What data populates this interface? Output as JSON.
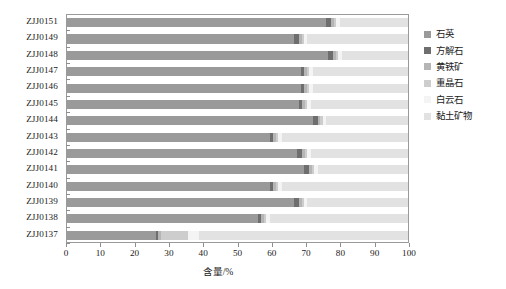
{
  "chart_data": {
    "type": "bar",
    "subtype": "horizontal-stacked-bar",
    "title": "",
    "xlabel": "含量/%",
    "ylabel": "",
    "xlim": [
      0,
      100
    ],
    "xticks": [
      0,
      10,
      20,
      30,
      40,
      50,
      60,
      70,
      80,
      90,
      100
    ],
    "grid": false,
    "legend_position": "right",
    "categories": [
      "ZJJ0151",
      "ZJJ0149",
      "ZJJ0148",
      "ZJJ0147",
      "ZJJ0146",
      "ZJJ0145",
      "ZJJ0144",
      "ZJJ0143",
      "ZJJ0142",
      "ZJJ0141",
      "ZJJ0140",
      "ZJJ0139",
      "ZJJ0138",
      "ZJJ0137"
    ],
    "series": [
      {
        "name": "石英",
        "color": "#9a9a9a",
        "values": [
          76.0,
          66.5,
          76.5,
          68.5,
          68.5,
          68.0,
          72.0,
          59.5,
          67.5,
          69.5,
          59.5,
          66.5,
          56.0,
          26.0
        ]
      },
      {
        "name": "方解石",
        "color": "#6e6e6e",
        "values": [
          1.5,
          1.5,
          1.5,
          1.0,
          1.0,
          1.0,
          1.5,
          1.0,
          1.5,
          1.5,
          1.0,
          1.5,
          1.0,
          0.8
        ]
      },
      {
        "name": "黄铁矿",
        "color": "#b5b5b5",
        "values": [
          0.8,
          0.8,
          0.8,
          0.8,
          0.8,
          0.8,
          0.8,
          0.8,
          0.8,
          0.8,
          0.8,
          0.8,
          0.8,
          0.8
        ]
      },
      {
        "name": "重晶石",
        "color": "#cdcdcd",
        "values": [
          0.7,
          0.7,
          0.7,
          0.7,
          0.7,
          0.7,
          0.7,
          0.7,
          0.7,
          0.7,
          0.7,
          0.7,
          0.7,
          8.0
        ]
      },
      {
        "name": "白云石",
        "color": "#f4f4f4",
        "values": [
          1.0,
          1.0,
          1.0,
          1.0,
          1.0,
          1.0,
          1.0,
          1.0,
          1.0,
          1.0,
          1.0,
          1.0,
          1.0,
          3.0
        ]
      },
      {
        "name": "黏土矿物",
        "color": "#e2e2e2",
        "values": [
          20.0,
          29.5,
          19.5,
          28.0,
          28.0,
          28.5,
          24.0,
          37.0,
          28.5,
          26.5,
          37.0,
          29.5,
          40.5,
          61.4
        ]
      }
    ]
  },
  "axis": {
    "x_title": "含量/%",
    "tick_labels": [
      "0",
      "10",
      "20",
      "30",
      "40",
      "50",
      "60",
      "70",
      "80",
      "90",
      "100"
    ]
  },
  "legend": {
    "items": [
      {
        "label": "石英",
        "color": "#9a9a9a"
      },
      {
        "label": "方解石",
        "color": "#6e6e6e"
      },
      {
        "label": "黄铁矿",
        "color": "#b5b5b5"
      },
      {
        "label": "重晶石",
        "color": "#cdcdcd"
      },
      {
        "label": "白云石",
        "color": "#f4f4f4"
      },
      {
        "label": "黏土矿物",
        "color": "#e2e2e2"
      }
    ]
  },
  "style": {
    "frame_color": "#9a9a9a",
    "background": "#ffffff",
    "text_color": "#1a1a1a"
  }
}
